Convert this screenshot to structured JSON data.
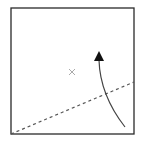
{
  "diagram": {
    "type": "paper-folding-step",
    "square": {
      "x": 11,
      "y": 8,
      "size": 123,
      "stroke": "#2a2a2a"
    },
    "fold_line": {
      "style": "dashed",
      "x1": 11,
      "y1": 134,
      "x2": 134,
      "y2": 82,
      "stroke": "#555555"
    },
    "center_mark": {
      "symbol": "×",
      "x": 72,
      "y": 72,
      "color": "#aaaaaa"
    },
    "fold_arrow": {
      "stroke": "#444444",
      "path": "M125 127 Q 100 95 99 60",
      "head": {
        "tip_x": 99,
        "tip_y": 51,
        "base_y": 61,
        "half_width": 5,
        "fill": "#111111"
      }
    }
  }
}
